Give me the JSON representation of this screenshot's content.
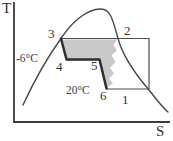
{
  "diagram": {
    "kind": "temperature-entropy cycle diagram",
    "axes": {
      "y_label": "T",
      "x_label": "S"
    },
    "state_points": {
      "p1": "1",
      "p2": "2",
      "p3": "3",
      "p4": "4",
      "p5": "5",
      "p6": "6"
    },
    "temperatures": {
      "upper": "-6°C",
      "lower": "20°C"
    },
    "colors": {
      "shading": "#c9c9c9",
      "ink": "#333333",
      "background": "#ffffff"
    }
  }
}
